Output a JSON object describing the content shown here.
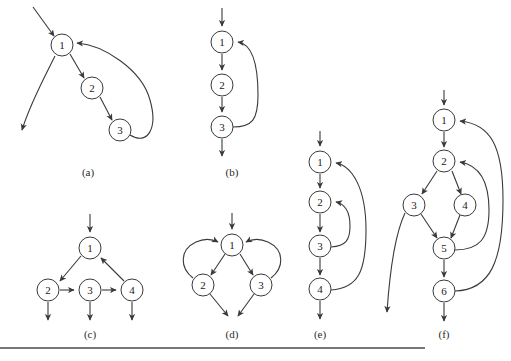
{
  "figure": {
    "background_color": "#ffffff",
    "stroke_color": "#3a3a3a",
    "node_fill": "#ffffff",
    "rule": {
      "x1": 0,
      "y1": 348,
      "x2": 425,
      "y2": 348,
      "color": "#4a4a4a"
    }
  },
  "panels": [
    {
      "id": "a",
      "caption": "(a)",
      "caption_x": 88,
      "caption_y": 176,
      "nodes": [
        {
          "label": "1",
          "cx": 62,
          "cy": 45,
          "r": 11
        },
        {
          "label": "2",
          "cx": 92,
          "cy": 88,
          "r": 11
        },
        {
          "label": "3",
          "cx": 120,
          "cy": 130,
          "r": 11
        }
      ],
      "edges": [
        {
          "from": "entry",
          "to": "1",
          "kind": "entry"
        },
        {
          "from": "1",
          "to": "2",
          "kind": "straight"
        },
        {
          "from": "2",
          "to": "3",
          "kind": "straight"
        },
        {
          "from": "3",
          "to": "1",
          "kind": "back-curve-right"
        },
        {
          "from": "1",
          "to": "exit",
          "kind": "exit-curve-left"
        }
      ]
    },
    {
      "id": "b",
      "caption": "(b)",
      "caption_x": 232,
      "caption_y": 176,
      "nodes": [
        {
          "label": "1",
          "cx": 222,
          "cy": 42,
          "r": 11
        },
        {
          "label": "2",
          "cx": 222,
          "cy": 85,
          "r": 11
        },
        {
          "label": "3",
          "cx": 222,
          "cy": 127,
          "r": 11
        }
      ],
      "edges": [
        {
          "from": "entry",
          "to": "1",
          "kind": "entry"
        },
        {
          "from": "1",
          "to": "2",
          "kind": "straight"
        },
        {
          "from": "2",
          "to": "3",
          "kind": "straight"
        },
        {
          "from": "3",
          "to": "1",
          "kind": "back-curve-right"
        },
        {
          "from": "3",
          "to": "exit",
          "kind": "exit-down"
        }
      ]
    },
    {
      "id": "c",
      "caption": "(c)",
      "caption_x": 90,
      "caption_y": 338,
      "nodes": [
        {
          "label": "1",
          "cx": 90,
          "cy": 248,
          "r": 11
        },
        {
          "label": "2",
          "cx": 48,
          "cy": 290,
          "r": 11
        },
        {
          "label": "3",
          "cx": 90,
          "cy": 290,
          "r": 11
        },
        {
          "label": "4",
          "cx": 132,
          "cy": 290,
          "r": 11
        }
      ],
      "edges": [
        {
          "from": "entry",
          "to": "1",
          "kind": "entry"
        },
        {
          "from": "1",
          "to": "2",
          "kind": "straight"
        },
        {
          "from": "2",
          "to": "3",
          "kind": "straight"
        },
        {
          "from": "3",
          "to": "4",
          "kind": "straight"
        },
        {
          "from": "4",
          "to": "1",
          "kind": "straight"
        },
        {
          "from": "2",
          "to": "exit",
          "kind": "exit-down"
        },
        {
          "from": "3",
          "to": "exit",
          "kind": "exit-down"
        },
        {
          "from": "4",
          "to": "exit",
          "kind": "exit-down"
        }
      ]
    },
    {
      "id": "d",
      "caption": "(d)",
      "caption_x": 232,
      "caption_y": 338,
      "nodes": [
        {
          "label": "1",
          "cx": 232,
          "cy": 245,
          "r": 11
        },
        {
          "label": "2",
          "cx": 203,
          "cy": 285,
          "r": 11
        },
        {
          "label": "3",
          "cx": 261,
          "cy": 285,
          "r": 11
        }
      ],
      "edges": [
        {
          "from": "entry",
          "to": "1",
          "kind": "entry"
        },
        {
          "from": "1",
          "to": "2",
          "kind": "straight"
        },
        {
          "from": "1",
          "to": "3",
          "kind": "straight"
        },
        {
          "from": "2",
          "to": "1",
          "kind": "back-curve-left"
        },
        {
          "from": "3",
          "to": "1",
          "kind": "back-curve-right"
        },
        {
          "from": "2",
          "to": "exit",
          "kind": "exit-diagonal"
        },
        {
          "from": "3",
          "to": "exit",
          "kind": "exit-diagonal"
        }
      ]
    },
    {
      "id": "e",
      "caption": "(e)",
      "caption_x": 320,
      "caption_y": 338,
      "nodes": [
        {
          "label": "1",
          "cx": 320,
          "cy": 162,
          "r": 11
        },
        {
          "label": "2",
          "cx": 320,
          "cy": 202,
          "r": 11
        },
        {
          "label": "3",
          "cx": 320,
          "cy": 246,
          "r": 11
        },
        {
          "label": "4",
          "cx": 320,
          "cy": 289,
          "r": 11
        }
      ],
      "edges": [
        {
          "from": "entry",
          "to": "1",
          "kind": "entry"
        },
        {
          "from": "1",
          "to": "2",
          "kind": "straight"
        },
        {
          "from": "2",
          "to": "3",
          "kind": "straight"
        },
        {
          "from": "3",
          "to": "4",
          "kind": "straight"
        },
        {
          "from": "3",
          "to": "2",
          "kind": "back-curve-right-inner"
        },
        {
          "from": "4",
          "to": "1",
          "kind": "back-curve-right-outer"
        },
        {
          "from": "4",
          "to": "exit",
          "kind": "exit-down"
        }
      ]
    },
    {
      "id": "f",
      "caption": "(f)",
      "caption_x": 444,
      "caption_y": 338,
      "nodes": [
        {
          "label": "1",
          "cx": 444,
          "cy": 120,
          "r": 11
        },
        {
          "label": "2",
          "cx": 444,
          "cy": 161,
          "r": 11
        },
        {
          "label": "3",
          "cx": 414,
          "cy": 205,
          "r": 11
        },
        {
          "label": "4",
          "cx": 465,
          "cy": 205,
          "r": 11
        },
        {
          "label": "5",
          "cx": 444,
          "cy": 248,
          "r": 11
        },
        {
          "label": "6",
          "cx": 444,
          "cy": 291,
          "r": 11
        }
      ],
      "edges": [
        {
          "from": "entry",
          "to": "1",
          "kind": "entry"
        },
        {
          "from": "1",
          "to": "2",
          "kind": "straight"
        },
        {
          "from": "2",
          "to": "3",
          "kind": "straight"
        },
        {
          "from": "2",
          "to": "4",
          "kind": "straight"
        },
        {
          "from": "3",
          "to": "5",
          "kind": "straight"
        },
        {
          "from": "4",
          "to": "5",
          "kind": "straight"
        },
        {
          "from": "5",
          "to": "6",
          "kind": "straight"
        },
        {
          "from": "5",
          "to": "2",
          "kind": "back-curve-right-inner"
        },
        {
          "from": "6",
          "to": "1",
          "kind": "back-curve-right-outer"
        },
        {
          "from": "3",
          "to": "exit",
          "kind": "exit-curve-left"
        },
        {
          "from": "6",
          "to": "exit",
          "kind": "exit-down"
        }
      ]
    }
  ]
}
